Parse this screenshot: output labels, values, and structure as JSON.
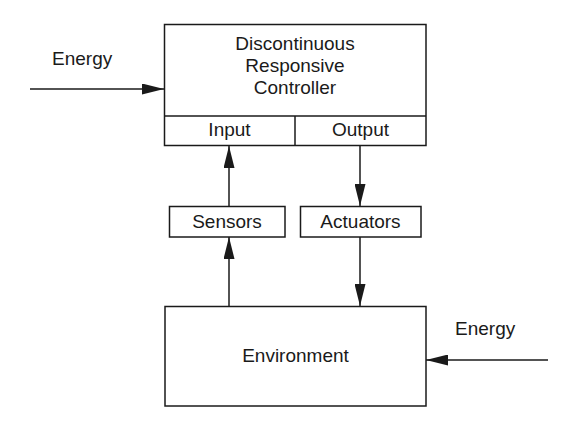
{
  "diagram": {
    "controller": {
      "lines": [
        "Discontinuous",
        "Responsive",
        "Controller"
      ]
    },
    "input_label": "Input",
    "output_label": "Output",
    "sensors_label": "Sensors",
    "actuators_label": "Actuators",
    "environment_label": "Environment",
    "energy_left_label": "Energy",
    "energy_right_label": "Energy"
  }
}
